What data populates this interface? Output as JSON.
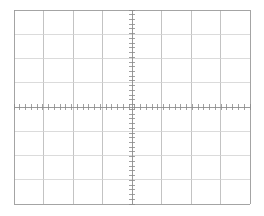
{
  "canvas": {
    "width": 264,
    "height": 216,
    "background_color": "#ffffff",
    "title": "Oscilloscope Graticule"
  },
  "graticule": {
    "name": "oscilloscope-graticule",
    "description": "8 by 8 division CRT oscilloscope graticule with center crosshair axes and fine tick subdivisions",
    "plot_area": {
      "left": 14,
      "top": 10,
      "right": 250,
      "bottom": 204,
      "width": 236,
      "height": 194
    },
    "divisions": {
      "horizontal": 8,
      "vertical": 8,
      "division_width_px": 29.5,
      "division_height_px": 24.25,
      "subdivisions_per_division": 5
    },
    "center_axes": {
      "vertical_axis_x": 132,
      "horizontal_axis_y": 107
    },
    "colors": {
      "border": "#9a9a9a",
      "gridline": "#b4b4b4",
      "gridline_light": "#d2d2d2",
      "axis": "#8e8e8e",
      "tick": "#8a8a8a"
    },
    "stroke_widths": {
      "border": 0.9,
      "gridline": 0.8,
      "axis": 0.9,
      "tick": 0.8
    },
    "tick_marks": {
      "horizontal_axis_tick_half_length": 3.2,
      "vertical_axis_tick_half_length": 3.2,
      "horizontal_axis_tick_spacing_px": 5.9,
      "vertical_axis_tick_spacing_px": 4.85,
      "horizontal_axis_tick_count": 41,
      "vertical_axis_tick_count": 41
    }
  }
}
